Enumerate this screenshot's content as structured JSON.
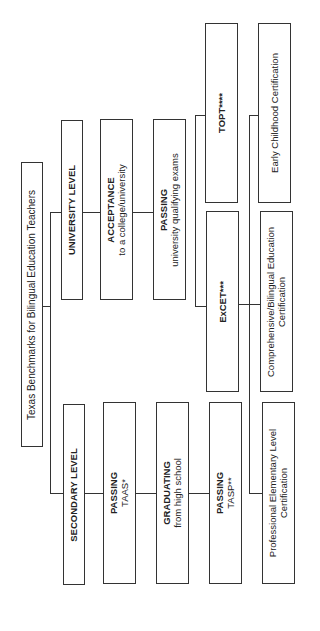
{
  "title": "Texas Benchmarks for Bilingual Education Teachers",
  "university": {
    "level": "UNIVERSITY LEVEL",
    "acceptance": {
      "head": "ACCEPTANCE",
      "sub": "to a college/university"
    },
    "passing": {
      "head": "PASSING",
      "sub": "university qualifying exams"
    }
  },
  "secondary": {
    "level": "SECONDARY LEVEL",
    "passing_taas": {
      "head": "PASSING",
      "sub": "TAAS*"
    },
    "graduating": {
      "head": "GRADUATING",
      "sub": "from high school"
    },
    "passing_tasp": {
      "head": "PASSING",
      "sub": "TASP**"
    }
  },
  "exams": {
    "topt": "TOPT****",
    "excet": "ExCET***"
  },
  "certifications": {
    "early_childhood": "Early Childhood Certification",
    "comprehensive": {
      "line1": "Comprehensive/Bilingual Education",
      "line2": "Certification"
    },
    "professional": {
      "line1": "Professional Elementary Level",
      "line2": "Certification"
    }
  }
}
